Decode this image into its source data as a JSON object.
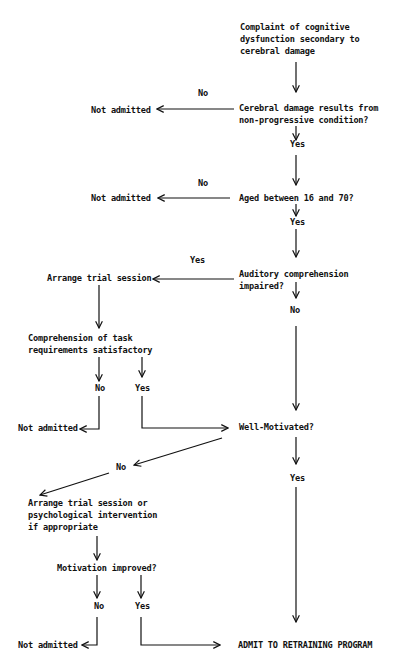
{
  "diagram": {
    "type": "flowchart",
    "colors": {
      "ink": "#111111",
      "background": "#ffffff"
    },
    "nodes": {
      "start": "Complaint of cognitive\ndysfunction secondary to\ncerebral damage",
      "q_nonprogressive": "Cerebral damage results from\nnon-progressive condition?",
      "q_age": "Aged between 16 and 70?",
      "q_auditory": "Auditory comprehension\nimpaired?",
      "arrange_trial": "Arrange trial session",
      "q_task_comprehension": "Comprehension of task\nrequirements satisfactory",
      "q_motivated": "Well-Motivated?",
      "arrange_intervention": "Arrange trial session or\npsychological intervention\nif appropriate",
      "q_motivation_improved": "Motivation improved?",
      "admit": "ADMIT TO RETRAINING PROGRAM",
      "not_admitted_1": "Not admitted",
      "not_admitted_2": "Not admitted",
      "not_admitted_3": "Not admitted",
      "not_admitted_4": "Not admitted"
    },
    "labels": {
      "no_1": "No",
      "yes_1": "Yes",
      "no_2": "No",
      "yes_2": "Yes",
      "yes_3": "Yes",
      "no_3": "No",
      "no_4": "No",
      "yes_4": "Yes",
      "no_5": "No",
      "yes_5": "Yes",
      "no_6": "No",
      "yes_6": "Yes"
    }
  }
}
